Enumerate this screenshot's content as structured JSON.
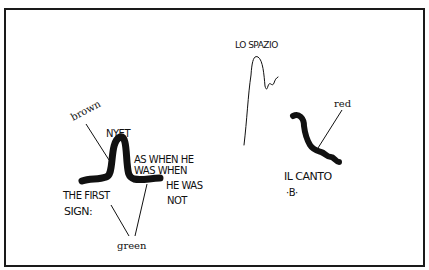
{
  "figure": {
    "left_sign": {
      "caption_lines": [
        "THE FIRST",
        "SIGN:"
      ],
      "peak_label": "NYET",
      "side_text_lines": [
        "AS WHEN  HE",
        "WAS  WHEN",
        "HE  WAS",
        "NOT"
      ],
      "color_labels": {
        "peak": "brown",
        "base": "green"
      }
    },
    "right_sign": {
      "top_label": "LO  SPAZIO",
      "caption_lines": [
        "IL  CANTO",
        "·B·"
      ],
      "color_labels": {
        "curve": "red"
      }
    }
  }
}
